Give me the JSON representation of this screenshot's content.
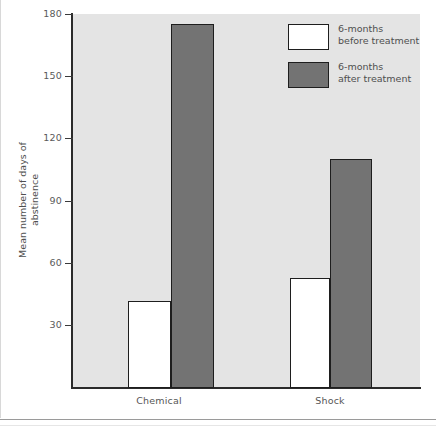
{
  "chart_data": {
    "type": "bar",
    "title": "",
    "xlabel": "",
    "ylabel": "Mean number of days of\nabstinence",
    "categories": [
      "Chemical",
      "Shock"
    ],
    "series": [
      {
        "name": "6-months\nbefore treatment",
        "color": "#ffffff",
        "values": [
          42,
          53
        ]
      },
      {
        "name": "6-months\nafter treatment",
        "color": "#737373",
        "values": [
          175,
          110
        ]
      }
    ],
    "ylim": [
      0,
      180
    ],
    "yticks": [
      30,
      60,
      90,
      120,
      150,
      180
    ],
    "ytick_labels": [
      "30",
      "60",
      "90",
      "120",
      "150",
      "180"
    ],
    "grid": false,
    "legend_position": "top-right",
    "plot_background": "#e4e4e4",
    "axis_color": "#2b2b2b"
  },
  "legend": {
    "items": [
      {
        "label": "6-months\nbefore treatment",
        "swatch": "white"
      },
      {
        "label": "6-months\nafter treatment",
        "swatch": "dark-gray"
      }
    ]
  },
  "axes": {
    "y_title": "Mean number of days of\nabstinence",
    "y_ticks": [
      "180",
      "150",
      "120",
      "90",
      "60",
      "30"
    ],
    "x_categories": [
      "Chemical",
      "Shock"
    ]
  }
}
